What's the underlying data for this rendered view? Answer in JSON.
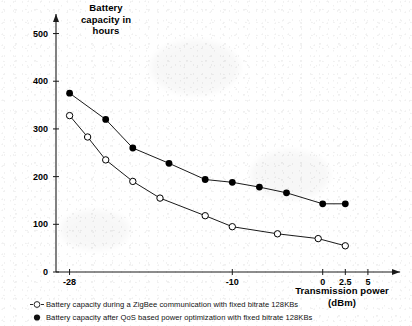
{
  "chart_data": {
    "type": "line",
    "title": "",
    "ylabel": "Battery\ncapacity in\nhours",
    "ylabel_lines": [
      "Battery",
      "capacity in",
      "hours"
    ],
    "xlabel": "Transmission power\n(dBm)",
    "xlabel_lines": [
      "Transmission power",
      "(dBm)"
    ],
    "xlim": [
      -29.5,
      7.0
    ],
    "ylim": [
      0,
      520
    ],
    "grid": false,
    "legend_position": "below-plot",
    "yticks": [
      0,
      100,
      200,
      300,
      400,
      500
    ],
    "ytick_labels": [
      "0",
      "100",
      "200",
      "300",
      "400",
      "500"
    ],
    "xticks": [
      -28,
      -10,
      0,
      2.5,
      5
    ],
    "xtick_labels": [
      "-28",
      "-10",
      "0",
      "2.5",
      "5"
    ],
    "series": [
      {
        "name": "Battery capacity during a ZigBee communication with fixed bitrate 128KBs",
        "marker": "open-circle",
        "color": "#000000",
        "x": [
          -28.0,
          -26.0,
          -24.0,
          -21.0,
          -18.0,
          -13.0,
          -10.0,
          -5.0,
          -0.5,
          2.5
        ],
        "y": [
          328,
          283,
          235,
          190,
          155,
          118,
          95,
          80,
          70,
          55
        ]
      },
      {
        "name": "Battery capacity after QoS based power optimization with fixed bitrate 128KBs",
        "marker": "filled-circle",
        "color": "#000000",
        "x": [
          -28.0,
          -24.0,
          -21.0,
          -17.0,
          -13.0,
          -10.0,
          -7.0,
          -4.0,
          0.0,
          2.5
        ],
        "y": [
          375,
          320,
          260,
          228,
          194,
          188,
          178,
          166,
          143,
          143
        ]
      }
    ]
  },
  "axes": {
    "ylabel_text": "Battery capacity in hours",
    "xlabel_text": "Transmission power (dBm)"
  },
  "legend": {
    "items": [
      {
        "marker": "open-circle",
        "label": "Battery capacity during a ZigBee communication with fixed bitrate 128KBs"
      },
      {
        "marker": "filled-circle",
        "label": "Battery capacity after QoS based power optimization with fixed bitrate 128KBs"
      }
    ]
  }
}
